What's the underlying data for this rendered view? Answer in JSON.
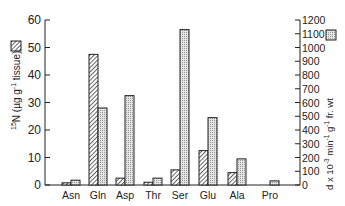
{
  "chart_data": {
    "type": "bar",
    "title": "",
    "categories": [
      "Asn",
      "Gln",
      "Asp",
      "Thr",
      "Ser",
      "Glu",
      "Ala",
      "Pro"
    ],
    "series": [
      {
        "name": "15N (µg g-1 tissue)",
        "pattern": "hatched",
        "axis": "left",
        "values": [
          0.8,
          47.5,
          2.5,
          1.0,
          5.5,
          12.5,
          4.5,
          0
        ]
      },
      {
        "name": "d x 10-3 min-1 g-1 fr. wt",
        "pattern": "stippled",
        "axis": "right",
        "values": [
          35,
          560,
          650,
          50,
          1130,
          490,
          190,
          30
        ]
      }
    ],
    "ylabel_left": "15N (µg g-1 tissue)",
    "ylabel_right": "d x 10-3 min-1 g-1 fr. wt",
    "ylim_left": [
      0,
      60
    ],
    "ylim_right": [
      0,
      1200
    ],
    "yticks_left": [
      0,
      10,
      20,
      30,
      40,
      50,
      60
    ],
    "yticks_right": [
      0,
      100,
      200,
      300,
      400,
      500,
      600,
      700,
      800,
      900,
      1000,
      1100,
      1200
    ],
    "grid": false,
    "legend": "inline swatches beside axis labels"
  },
  "labels": {
    "left_axis": {
      "sup": "15",
      "main": "N (",
      "mu": "µg g",
      "exp": "-1",
      "tail": " tissue)"
    },
    "right_axis": {
      "main": "d x 10",
      "exp1": "-3",
      "mid": " min",
      "exp2": "-1",
      "g": " g",
      "exp3": "-1",
      "tail": " fr. wt"
    }
  }
}
